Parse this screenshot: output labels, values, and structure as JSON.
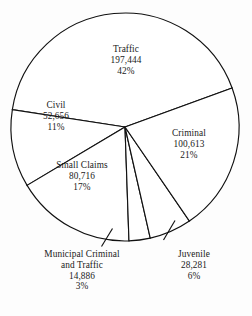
{
  "chart_data": {
    "type": "pie",
    "title": "",
    "subtitle": "",
    "xlabel": "",
    "ylabel": "",
    "grid": false,
    "legend_position": "none",
    "label_format": "name, value, percent",
    "total_value": "474,596",
    "categories": [
      "Traffic",
      "Criminal",
      "Juvenile",
      "Municipal Criminal and Traffic",
      "Small Claims",
      "Civil"
    ],
    "values": [
      197444,
      100613,
      28281,
      14886,
      80716,
      52656
    ],
    "percents": [
      42,
      21,
      6,
      3,
      17,
      11
    ],
    "slices": [
      {
        "name": "Traffic",
        "name_line1": "Traffic",
        "name_line2": "",
        "value": 197444,
        "value_label": "197,444",
        "percent": 42,
        "percent_label": "42%",
        "label_placement": "inside",
        "leader": false
      },
      {
        "name": "Criminal",
        "name_line1": "Criminal",
        "name_line2": "",
        "value": 100613,
        "value_label": "100,613",
        "percent": 21,
        "percent_label": "21%",
        "label_placement": "inside",
        "leader": false
      },
      {
        "name": "Juvenile",
        "name_line1": "Juvenile",
        "name_line2": "",
        "value": 28281,
        "value_label": "28,281",
        "percent": 6,
        "percent_label": "6%",
        "label_placement": "outside-bottom-right",
        "leader": true
      },
      {
        "name": "Municipal Criminal and Traffic",
        "name_line1": "Municipal Criminal",
        "name_line2": "and Traffic",
        "value": 14886,
        "value_label": "14,886",
        "percent": 3,
        "percent_label": "3%",
        "label_placement": "outside-bottom-left",
        "leader": true
      },
      {
        "name": "Small Claims",
        "name_line1": "Small Claims",
        "name_line2": "",
        "value": 80716,
        "value_label": "80,716",
        "percent": 17,
        "percent_label": "17%",
        "label_placement": "inside",
        "leader": false
      },
      {
        "name": "Civil",
        "name_line1": "Civil",
        "name_line2": "",
        "value": 52656,
        "value_label": "52,656",
        "percent": 11,
        "percent_label": "11%",
        "label_placement": "inside",
        "leader": false
      }
    ],
    "colors": {
      "slice_fill": "#ffffff",
      "slice_stroke": "#111111",
      "background": "#fdfdfd",
      "text": "#1a1a1a"
    }
  }
}
